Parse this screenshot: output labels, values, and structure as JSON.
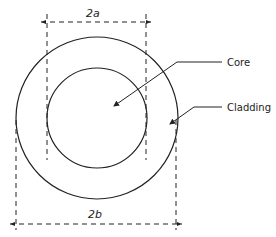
{
  "diagram": {
    "type": "optical-fiber-cross-section",
    "labels": {
      "core": "Core",
      "cladding": "Cladding",
      "core_diameter": "2a",
      "cladding_diameter": "2b"
    },
    "colors": {
      "line": "#222222",
      "background": "#ffffff"
    }
  }
}
